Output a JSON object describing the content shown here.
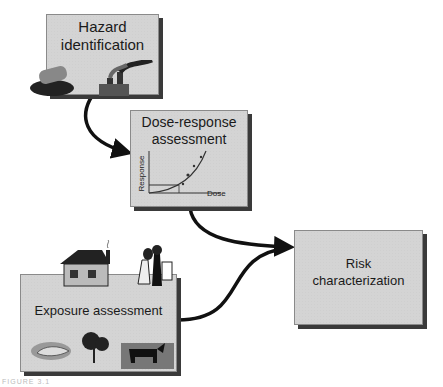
{
  "diagram": {
    "nodes": [
      {
        "id": "hazard",
        "line1": "Hazard",
        "line2": "identification"
      },
      {
        "id": "dose",
        "line1": "Dose-response",
        "line2": "assessment",
        "chart": {
          "ylabel": "Response",
          "xlabel": "Dose"
        }
      },
      {
        "id": "risk",
        "line1": "Risk",
        "line2": "characterization"
      },
      {
        "id": "exposure",
        "line1": "Exposure assessment"
      }
    ],
    "edges": [
      {
        "from": "hazard",
        "to": "dose"
      },
      {
        "from": "dose",
        "to": "risk"
      },
      {
        "from": "exposure",
        "to": "risk"
      }
    ],
    "caption": "FIGURE 3.1"
  }
}
